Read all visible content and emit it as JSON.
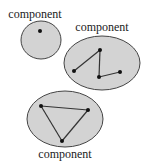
{
  "components": [
    {
      "label": "component",
      "label_pos": [
        35,
        18
      ],
      "shape": {
        "cx": 41,
        "cy": 40,
        "rx": 20,
        "ry": 19
      },
      "nodes": [
        [
          40,
          31
        ]
      ],
      "edges": []
    },
    {
      "label": "component",
      "label_pos": [
        102,
        31
      ],
      "shape": {
        "cx": 102,
        "cy": 63,
        "rx": 38,
        "ry": 27
      },
      "nodes": [
        [
          100,
          50
        ],
        [
          74,
          71
        ],
        [
          99,
          77
        ],
        [
          120,
          72
        ]
      ],
      "edges": [
        [
          0,
          1
        ],
        [
          0,
          2
        ],
        [
          2,
          3
        ]
      ]
    },
    {
      "label": "component",
      "label_pos": [
        65,
        158
      ],
      "shape": {
        "cx": 65,
        "cy": 119,
        "rx": 38,
        "ry": 28
      },
      "nodes": [
        [
          41,
          106
        ],
        [
          88,
          110
        ],
        [
          62,
          141
        ]
      ],
      "edges": [
        [
          0,
          1
        ],
        [
          1,
          2
        ],
        [
          2,
          0
        ]
      ]
    }
  ],
  "colors": {
    "fill": "#d3d3d3",
    "stroke": "#444444",
    "node": "#111111"
  }
}
